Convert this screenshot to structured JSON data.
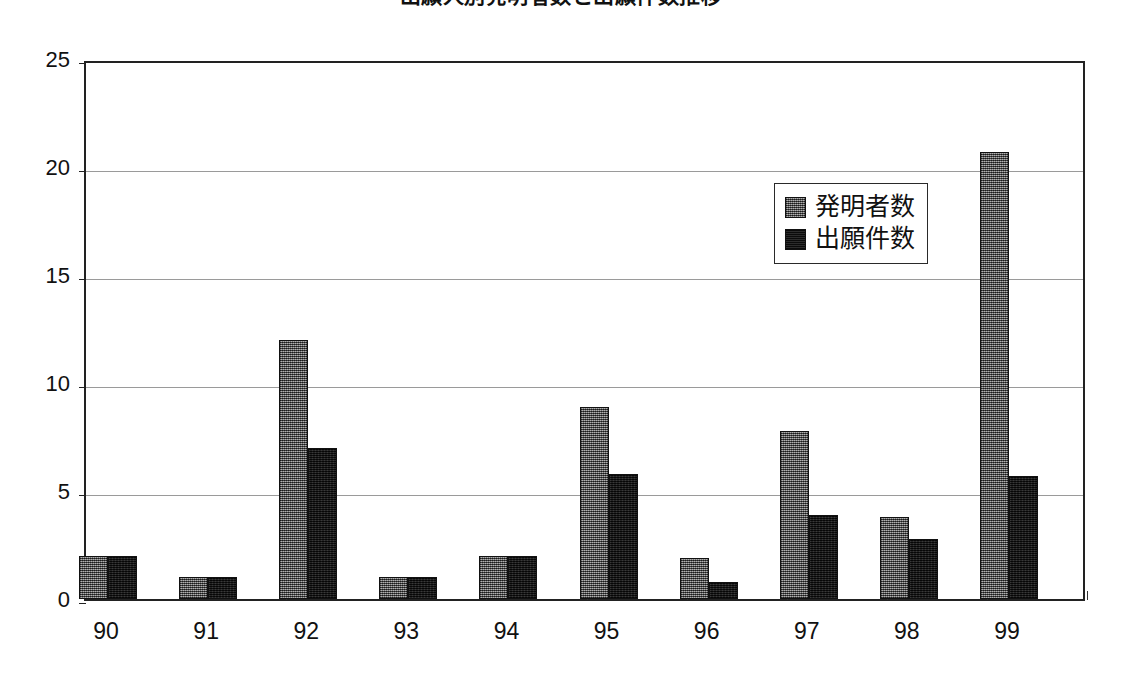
{
  "chart_data": {
    "type": "bar",
    "title": "出願人別発明者数と出願件数推移",
    "xlabel": "",
    "ylabel": "",
    "categories": [
      "90",
      "91",
      "92",
      "93",
      "94",
      "95",
      "96",
      "97",
      "98",
      "99"
    ],
    "series": [
      {
        "name": "発明者数",
        "values": [
          2.0,
          1.0,
          12.0,
          1.0,
          2.0,
          8.9,
          1.9,
          7.8,
          3.8,
          20.7
        ],
        "fill": "dithered-gray",
        "color": "#6d6d6d"
      },
      {
        "name": "出願件数",
        "values": [
          2.0,
          1.0,
          7.0,
          1.0,
          2.0,
          5.8,
          0.8,
          3.9,
          2.8,
          5.7
        ],
        "fill": "solid-black",
        "color": "#171717"
      }
    ],
    "ylim": [
      0,
      25
    ],
    "yticks": [
      0,
      5,
      10,
      15,
      20,
      25
    ],
    "ytick_labels": [
      "0",
      "5",
      "10",
      "15",
      "20",
      "25"
    ],
    "grid": true,
    "grid_axis": "y",
    "legend_position": "upper-right-inside",
    "plot_border_color": "#222222",
    "gridline_color": "#9a9a9a",
    "background_color": "#ffffff"
  },
  "legend": {
    "items": [
      {
        "label": "発明者数",
        "swatch": "series-inventors"
      },
      {
        "label": "出願件数",
        "swatch": "series-applications"
      }
    ]
  }
}
